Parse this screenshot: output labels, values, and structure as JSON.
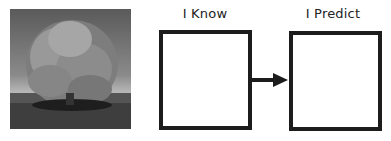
{
  "image": {
    "subject": "tree-photo",
    "style": "grayscale"
  },
  "columns": [
    {
      "label": "I Know"
    },
    {
      "label": "I Predict"
    }
  ],
  "connector": {
    "type": "arrow",
    "direction": "right"
  },
  "colors": {
    "border": "#1c1c1c",
    "background": "#ffffff",
    "text": "#222222"
  }
}
